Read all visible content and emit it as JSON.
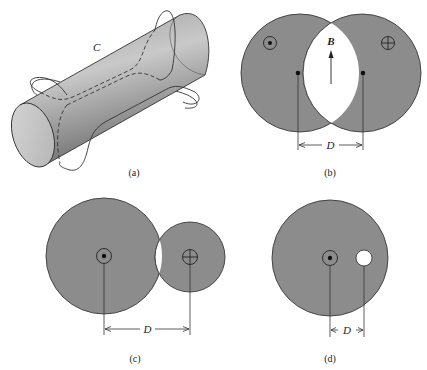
{
  "figure": {
    "panels": [
      {
        "id": "a",
        "caption": "(a)",
        "curve_label": "C",
        "description": "Cylinder with closed loop C threading in and out of its surface"
      },
      {
        "id": "b",
        "caption": "(b)",
        "field_label": "B",
        "distance_label": "D",
        "description": "Two overlapping equal circles carrying opposite currents; uniform field B in the lens-shaped hole"
      },
      {
        "id": "c",
        "caption": "(c)",
        "distance_label": "D",
        "description": "Large circle and small overlapping circle with opposite currents"
      },
      {
        "id": "d",
        "caption": "(d)",
        "distance_label": "D",
        "description": "Circle with off-center circular hole"
      }
    ],
    "symbols": {
      "out_of_page": "dot-in-circle",
      "into_page": "cross-in-circle"
    },
    "colors": {
      "fill": "#8c8c8c",
      "stroke": "#3a3a3a",
      "hole": "#ffffff"
    }
  }
}
